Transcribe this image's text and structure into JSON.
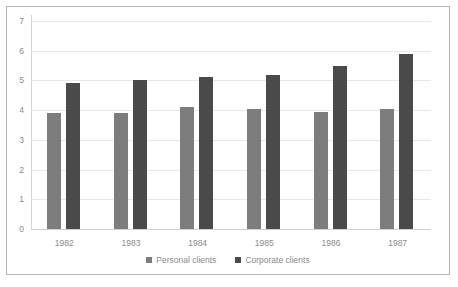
{
  "chart_data": {
    "type": "bar",
    "title": "",
    "xlabel": "",
    "ylabel": "",
    "categories": [
      "1982",
      "1983",
      "1984",
      "1985",
      "1986",
      "1987"
    ],
    "series": [
      {
        "name": "Personal clients",
        "color": "#7d7d7d",
        "values": [
          3.9,
          3.9,
          4.1,
          4.05,
          3.95,
          4.05
        ]
      },
      {
        "name": "Corporate clients",
        "color": "#4a4a4a",
        "values": [
          4.9,
          5.0,
          5.1,
          5.2,
          5.5,
          5.9
        ]
      }
    ],
    "ylim": [
      0,
      7
    ],
    "yticks": [
      0,
      1,
      2,
      3,
      4,
      5,
      6,
      7
    ],
    "ytick_labels": [
      "0",
      "1",
      "2",
      "3",
      "4",
      "5",
      "6",
      "7"
    ],
    "grid": true,
    "legend_position": "bottom",
    "grid_color": "#e8e8e8",
    "axis_text_color": "#8a8a8a",
    "border_color": "#b6b6b6",
    "background": "#ffffff"
  }
}
